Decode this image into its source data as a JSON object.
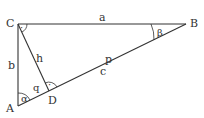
{
  "diagram": {
    "stroke_color": "#333333",
    "vertices": {
      "A": {
        "label": "A",
        "x": 18,
        "y": 106
      },
      "B": {
        "label": "B",
        "x": 186,
        "y": 24
      },
      "C": {
        "label": "C",
        "x": 18,
        "y": 24
      },
      "D": {
        "label": "D",
        "x": 49,
        "y": 91
      }
    },
    "sides": {
      "a": "a",
      "b": "b",
      "c": "c",
      "h": "h",
      "p": "p",
      "q": "q"
    },
    "angles": {
      "alpha": "α",
      "beta": "β",
      "right_angle_marker": "·"
    }
  }
}
